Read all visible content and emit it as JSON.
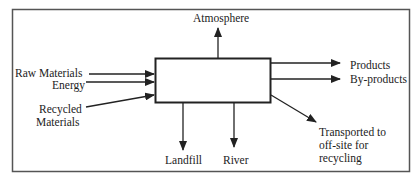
{
  "diagram": {
    "process_box": {
      "label": ""
    },
    "inputs": [
      {
        "label": "Raw Materials"
      },
      {
        "label": "Energy"
      },
      {
        "label": "Recycled"
      },
      {
        "label": "Materials"
      }
    ],
    "outputs": {
      "top": "Atmosphere",
      "right1": "Products",
      "right2": "By-products",
      "bottom1": "Landfill",
      "bottom2": "River",
      "diag_line1": "Transported to",
      "diag_line2": "off-site  for",
      "diag_line3": "recycling"
    },
    "colors": {
      "line": "#222222",
      "frame": "#555555"
    }
  }
}
